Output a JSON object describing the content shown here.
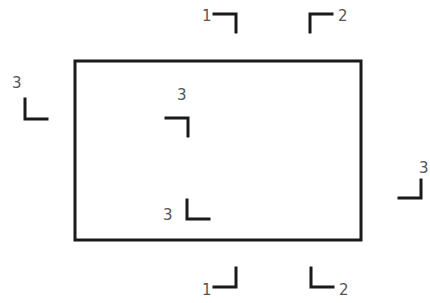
{
  "diagram": {
    "type": "registration-marks",
    "canvas": {
      "width": 430,
      "height": 303,
      "background": "#ffffff"
    },
    "stroke_color": "#1a1a1a",
    "label_color": "#555555",
    "rectangle": {
      "x": 75,
      "y": 61,
      "width": 286,
      "height": 179
    },
    "marks": [
      {
        "id": "top-left-1",
        "label": "1",
        "points": "214,14 236,14 236,32",
        "label_x": 202,
        "label_y": 21
      },
      {
        "id": "top-right-2",
        "label": "2",
        "points": "310,32 310,14 332,14",
        "label_x": 338,
        "label_y": 21
      },
      {
        "id": "left-outer-3",
        "label": "3",
        "points": "25,99 25,119 47,119",
        "label_x": 12,
        "label_y": 88
      },
      {
        "id": "inner-top-3",
        "label": "3",
        "points": "166,118 188,118 188,136",
        "label_x": 177,
        "label_y": 100
      },
      {
        "id": "inner-bottom-3",
        "label": "3",
        "points": "187,200 187,219 209,219",
        "label_x": 163,
        "label_y": 220
      },
      {
        "id": "right-outer-3",
        "label": "3",
        "points": "421,180 421,198 399,198",
        "label_x": 419,
        "label_y": 173
      },
      {
        "id": "bottom-left-1",
        "label": "1",
        "points": "236,268 236,287 214,287",
        "label_x": 202,
        "label_y": 295
      },
      {
        "id": "bottom-right-2",
        "label": "2",
        "points": "311,268 311,287 333,287",
        "label_x": 339,
        "label_y": 295
      }
    ]
  }
}
